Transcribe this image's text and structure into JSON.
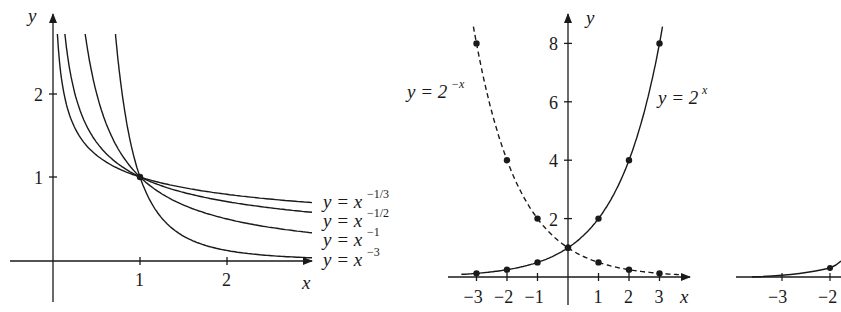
{
  "figure": {
    "background": "#ffffff",
    "ink": "#1a1a1a"
  },
  "chart_data": [
    {
      "id": "power-functions",
      "type": "line",
      "title": "",
      "xlabel": "x",
      "ylabel": "y",
      "xlim": [
        -0.5,
        3.0
      ],
      "ylim": [
        -0.5,
        2.8
      ],
      "x_ticks": [
        1,
        2
      ],
      "y_ticks": [
        1,
        2
      ],
      "x_tick_labels": [
        "1",
        "2"
      ],
      "y_tick_labels": [
        "1",
        "2"
      ],
      "grid": false,
      "legend_position": "inline-right",
      "series": [
        {
          "name": "y = x^{-1/3}",
          "label_base": "y = x",
          "label_exp": "−1/3",
          "exponent": -0.3333,
          "style": "solid"
        },
        {
          "name": "y = x^{-1/2}",
          "label_base": "y = x",
          "label_exp": "−1/2",
          "exponent": -0.5,
          "style": "solid"
        },
        {
          "name": "y = x^{-1}",
          "label_base": "y = x",
          "label_exp": "−1",
          "exponent": -1,
          "style": "solid"
        },
        {
          "name": "y = x^{-3}",
          "label_base": "y = x",
          "label_exp": "−3",
          "exponent": -3,
          "style": "solid"
        }
      ],
      "marked_points": [
        {
          "x": 1,
          "y": 1
        }
      ]
    },
    {
      "id": "exponential-functions",
      "type": "line",
      "title": "",
      "xlabel": "x",
      "ylabel": "y",
      "xlim": [
        -3.5,
        3.8
      ],
      "ylim": [
        -0.5,
        8.8
      ],
      "x_ticks": [
        -3,
        -2,
        -1,
        1,
        2,
        3
      ],
      "y_ticks": [
        2,
        4,
        6,
        8
      ],
      "x_tick_labels": [
        "−3",
        "−2",
        "−1",
        "1",
        "2",
        "3"
      ],
      "y_tick_labels": [
        "2",
        "4",
        "6",
        "8"
      ],
      "grid": false,
      "series": [
        {
          "name": "y = 2^x",
          "label_base": "y = 2",
          "label_exp": "x",
          "style": "solid",
          "x": [
            -3,
            -2,
            -1,
            0,
            1,
            2,
            3
          ],
          "values": [
            0.125,
            0.25,
            0.5,
            1,
            2,
            4,
            8
          ]
        },
        {
          "name": "y = 2^{-x}",
          "label_base": "y = 2",
          "label_exp": "−x",
          "style": "dashed",
          "x": [
            -3,
            -2,
            -1,
            0,
            1,
            2,
            3
          ],
          "values": [
            8,
            4,
            2,
            1,
            0.5,
            0.25,
            0.125
          ]
        }
      ]
    },
    {
      "id": "partial-third-chart",
      "type": "line",
      "xlabel": "",
      "ylabel": "",
      "x_ticks": [
        -3,
        -2
      ],
      "x_tick_labels": [
        "−3",
        "−2"
      ],
      "note": "cropped at right edge",
      "series": [
        {
          "name": "partial curve",
          "style": "solid",
          "x": [
            -2
          ],
          "values": [
            0.25
          ]
        }
      ]
    }
  ]
}
